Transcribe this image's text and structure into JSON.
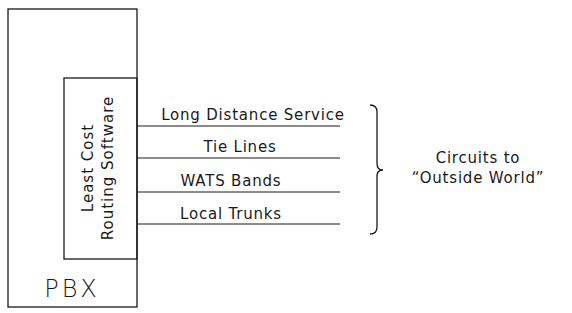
{
  "diagram": {
    "pbx": {
      "label": "PBX"
    },
    "software": {
      "line1": "Least Cost",
      "line2": "Routing Software"
    },
    "circuits": [
      {
        "label": "Long Distance Service"
      },
      {
        "label": "Tie Lines"
      },
      {
        "label": "WATS Bands"
      },
      {
        "label": "Local Trunks"
      }
    ],
    "group_label": {
      "line1": "Circuits to",
      "line2": "“Outside World”"
    },
    "colors": {
      "stroke": "#1a1a1a",
      "background": "#ffffff"
    }
  }
}
